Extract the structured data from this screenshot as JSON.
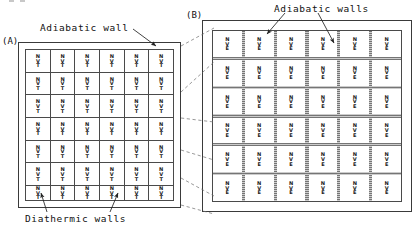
{
  "figure": {
    "background_color": "#ffffff",
    "line_color": "#3a3a3a",
    "shading_color": "#8e8e8e"
  },
  "panels": [
    {
      "tag": "(A)",
      "ensemble_label": "NVT",
      "annotations": [
        {
          "name": "adiabatic-wall-label",
          "text": "Adiabatic wall"
        },
        {
          "name": "diathermic-walls-label",
          "text": "Diathermic walls"
        }
      ],
      "grid": {
        "rows": 6,
        "columns": 6,
        "cell_lines": [
          "N",
          "V",
          "T"
        ],
        "divider_style": "thin-solid",
        "divider_meaning": "diathermic walls"
      }
    },
    {
      "tag": "(B)",
      "ensemble_label": "NVE",
      "annotations": [
        {
          "name": "adiabatic-walls-label",
          "text": "Adiabatic walls"
        }
      ],
      "grid": {
        "rows": 6,
        "columns": 6,
        "cell_lines": [
          "N",
          "V",
          "E"
        ],
        "divider_style": "shaded-band",
        "divider_meaning": "adiabatic walls"
      }
    }
  ],
  "cell_text": {
    "nvt": {
      "line1": "N",
      "line2": "V",
      "line3": "T"
    },
    "nve": {
      "line1": "N",
      "line2": "V",
      "line3": "E"
    }
  }
}
